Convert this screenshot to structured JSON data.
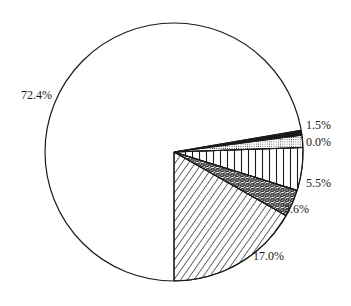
{
  "chart_data": {
    "type": "pie",
    "title": "",
    "legend": "none",
    "slices": [
      {
        "label": "72.4%",
        "value": 72.4,
        "pattern": "none",
        "start_deg": 29.6,
        "end_deg": 350.3
      },
      {
        "label": "1.5%",
        "value": 1.5,
        "pattern": "solid-black",
        "start_deg": -9.7,
        "end_deg": -7.5
      },
      {
        "label": "0.0%",
        "value": 0.0,
        "pattern": "dots",
        "start_deg": -7.5,
        "end_deg": -2.0
      },
      {
        "label": "5.5%",
        "value": 5.5,
        "pattern": "vertical-lines",
        "start_deg": -2.0,
        "end_deg": 17.3
      },
      {
        "label": "3.6%",
        "value": 3.6,
        "pattern": "crosshatch",
        "start_deg": 17.3,
        "end_deg": 29.6
      },
      {
        "label": "17.0%",
        "value": 17.0,
        "pattern": "diagonal-lines",
        "start_deg": 29.6,
        "end_deg": 90.0
      }
    ],
    "geometry": {
      "cx": 174,
      "cy": 152,
      "r": 129
    }
  },
  "labels": {
    "big": {
      "text": "72.4%",
      "x": 21,
      "y": 89
    },
    "black": {
      "text": "1.5%",
      "x": 306,
      "y": 119
    },
    "dots": {
      "text": "0.0%",
      "x": 306,
      "y": 136
    },
    "vertical": {
      "text": "5.5%",
      "x": 306,
      "y": 177
    },
    "cross": {
      "text": "3.6%",
      "x": 284,
      "y": 203
    },
    "diag": {
      "text": "17.0%",
      "x": 253,
      "y": 250
    }
  },
  "colors": {
    "stroke": "#1a1a1a",
    "background": "#ffffff"
  }
}
